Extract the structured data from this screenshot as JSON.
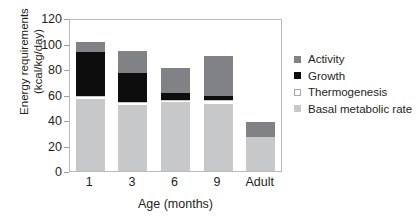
{
  "chart_data": {
    "type": "bar",
    "stacked": true,
    "title": "",
    "xlabel": "Age (months)",
    "ylabel": "Energy requirements (kcal/kg/day)",
    "ylabel_line1": "Energy requirements",
    "ylabel_line2": "(kcal/kg/day)",
    "categories": [
      "1",
      "3",
      "6",
      "9",
      "Adult"
    ],
    "ylim": [
      0,
      120
    ],
    "yticks": [
      0,
      20,
      40,
      60,
      80,
      100,
      120
    ],
    "grid": false,
    "legend_position": "right",
    "series": [
      {
        "name": "Basal metabolic rate",
        "color": "#c7c8ca",
        "values": [
          56,
          51,
          53,
          52,
          25
        ]
      },
      {
        "name": "Thermogenesis",
        "color": "#ffffff",
        "values": [
          3,
          3,
          3,
          4,
          1
        ]
      },
      {
        "name": "Growth",
        "color": "#0e0d0d",
        "values": [
          34,
          23,
          5,
          3,
          0
        ]
      },
      {
        "name": "Activity",
        "color": "#808285",
        "values": [
          8,
          17,
          20,
          31,
          12
        ]
      }
    ],
    "totals": [
      101,
      94,
      81,
      90,
      38
    ],
    "legend_order": [
      "Activity",
      "Growth",
      "Thermogenesis",
      "Basal metabolic rate"
    ]
  },
  "legend": {
    "items": [
      {
        "label": "Activity",
        "swatch": "activity-swatch"
      },
      {
        "label": "Growth",
        "swatch": "growth-swatch"
      },
      {
        "label": "Thermogenesis",
        "swatch": "thermogenesis-swatch"
      },
      {
        "label": "Basal metabolic rate",
        "swatch": "basal-metabolic-rate-swatch"
      }
    ]
  },
  "colors": {
    "activity": "#808285",
    "growth": "#0e0d0d",
    "thermogenesis": "#ffffff",
    "basal_metabolic_rate": "#c7c8ca",
    "axis": "#b9bcbe",
    "text": "#231f20",
    "background": "#ffffff"
  }
}
